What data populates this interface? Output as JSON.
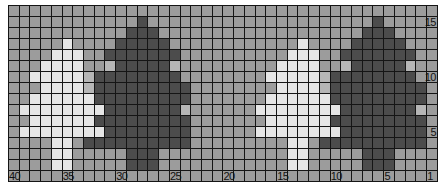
{
  "chart": {
    "title": "",
    "columns": 40,
    "rows": 16,
    "column_numbering": "right-to-left",
    "row_numbering": "bottom-to-top",
    "legend": {
      "M": {
        "name": "background",
        "color": "#9c9c9c"
      },
      "H": {
        "name": "background-light",
        "color": "#b6b6b6"
      },
      "L": {
        "name": "light-tree",
        "color": "#e6e6e6"
      },
      "D": {
        "name": "dark-tree",
        "color": "#4c4c4c"
      }
    },
    "grid_rows_top_to_bottom": [
      "MMMMMMMMMMMMMMMMMMMMMMMMMMMMMMMMMMMMMMMM",
      "MMMMMMMMMMMMDMMMMMMMMMMMMMMMMMMMMMDMMMMM",
      "MMMMMMMMMMMDDDMMMMMMMMMMMMMMMMMMMDDDMMMM",
      "MMMMMLMMMMDDDDDMMMMMMMMMMMMLMMMMDDDDDMMM",
      "MMMMLLLMMDDDDDDDMMMMMMMMMMLLLMMDDDDDDDMM",
      "MMMLLLLMMHDDDDDHMMMMMMMMMLLLLMMHDDDDDHMM",
      "MMLLLLLHDDDDDDDDMMMMMMMMLLLLLHDDDDDDDDMM",
      "MMMLLLLHDDDDDDDDDMMMMMMMMLLLLHDDDDDDDDDM",
      "MMLLLLLLDDDDDDDDDMMMMMMMLLLLLLDDDDDDDDDM",
      "MLLLLLLLLDDDDDDDHMMMMMMLLLLLLLLDDDDDDDHM",
      "MMLLLLLLDDDDDDDDDMMMMMMMLLLLLLDDDDDDDDDM",
      "MLLLLLLLLDDDDDDDDMMMMMMLLLLLLLLDDDDDDDDM",
      "MMMMLLMDDDDDDDDDDMMMMMMMMMLLMDDDDDDDDDDM",
      "MMMMLLMMMMMDDDMMMMMMMMMMMMLLMMMMMDDDMMMM",
      "MMMMLLMMMMMDDDMMMMMMMMMMMMLLMMMMMDDDMMMM",
      "MMMMMMMMMMMMMMMMMMMMMMMMMMMMMMMMMMMMMMMM"
    ],
    "column_labels": [
      {
        "text": "40",
        "col": 40
      },
      {
        "text": "35",
        "col": 35
      },
      {
        "text": "30",
        "col": 30
      },
      {
        "text": "25",
        "col": 25
      },
      {
        "text": "20",
        "col": 20
      },
      {
        "text": "15",
        "col": 15
      },
      {
        "text": "10",
        "col": 10
      },
      {
        "text": "5",
        "col": 5
      },
      {
        "text": "1",
        "col": 1
      }
    ],
    "row_labels": [
      {
        "text": "15",
        "row": 15
      },
      {
        "text": "10",
        "row": 10
      },
      {
        "text": "5",
        "row": 5
      }
    ]
  }
}
